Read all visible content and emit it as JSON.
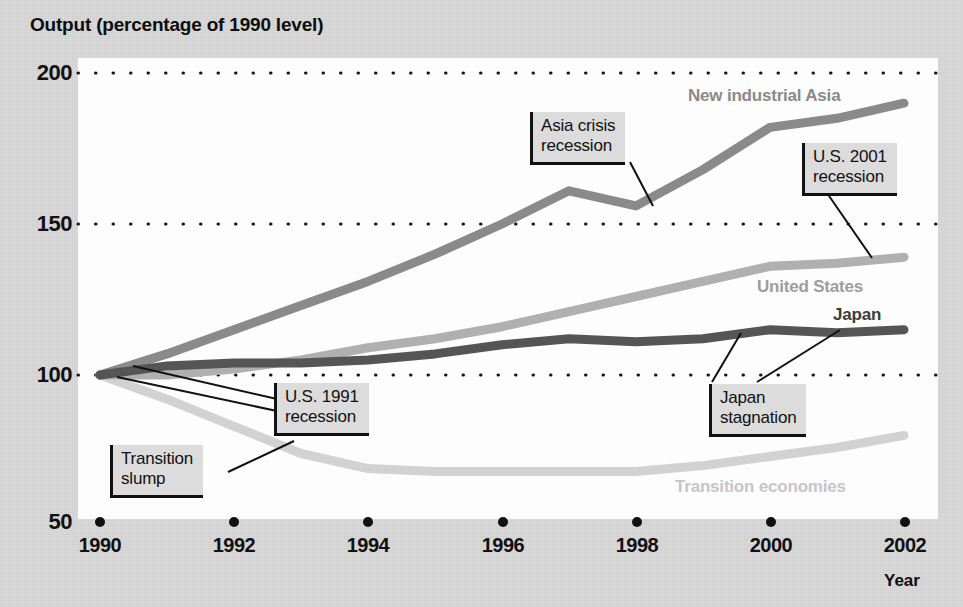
{
  "chart_data": {
    "type": "line",
    "title": "Output (percentage of 1990 level)",
    "xlabel": "Year",
    "ylabel": "Output (percentage of 1990 level)",
    "xlim": [
      1990,
      2002
    ],
    "ylim": [
      50,
      200
    ],
    "yticks": [
      "200",
      "150",
      "100",
      "50"
    ],
    "ytick_values": [
      200,
      150,
      100,
      50
    ],
    "xticks": [
      "1990",
      "1992",
      "1994",
      "1996",
      "1998",
      "2000",
      "2002"
    ],
    "xtick_values": [
      1990,
      1992,
      1994,
      1996,
      1998,
      2000,
      2002
    ],
    "grid": "horizontal dotted at 200, 150, 100",
    "legend": "inline series labels on plot",
    "x": [
      1990,
      1991,
      1992,
      1993,
      1994,
      1995,
      1996,
      1997,
      1998,
      1999,
      2000,
      2001,
      2002
    ],
    "series": [
      {
        "name": "New industrial Asia",
        "color": "#8a8a8a",
        "values": [
          100,
          107,
          115,
          123,
          131,
          140,
          150,
          161,
          156,
          168,
          182,
          185,
          190
        ]
      },
      {
        "name": "United States",
        "color": "#b0b0b0",
        "values": [
          100,
          100,
          102,
          105,
          109,
          112,
          116,
          121,
          126,
          131,
          136,
          137,
          139
        ]
      },
      {
        "name": "Japan",
        "color": "#555555",
        "values": [
          100,
          103,
          104,
          104,
          105,
          107,
          110,
          112,
          111,
          112,
          115,
          114,
          115
        ]
      },
      {
        "name": "Transition economies",
        "color": "#d2d2d2",
        "values": [
          100,
          92,
          83,
          74,
          69,
          68,
          68,
          68,
          68,
          70,
          73,
          76,
          80
        ]
      }
    ],
    "series_labels": [
      {
        "text": "New industrial Asia",
        "color": "#8a8a8a"
      },
      {
        "text": "United States",
        "color": "#9d9d9d"
      },
      {
        "text": "Japan",
        "color": "#3c3c3c"
      },
      {
        "text": "Transition economies",
        "color": "#c6c6c6"
      }
    ],
    "annotations": [
      {
        "text_line1": "Asia crisis",
        "text_line2": "recession"
      },
      {
        "text_line1": "U.S. 2001",
        "text_line2": "recession"
      },
      {
        "text_line1": "U.S. 1991",
        "text_line2": "recession"
      },
      {
        "text_line1": "Transition",
        "text_line2": "slump"
      },
      {
        "text_line1": "Japan",
        "text_line2": "stagnation"
      }
    ]
  },
  "labels": {
    "title": "Output (percentage of 1990 level)",
    "year_axis": "Year"
  }
}
